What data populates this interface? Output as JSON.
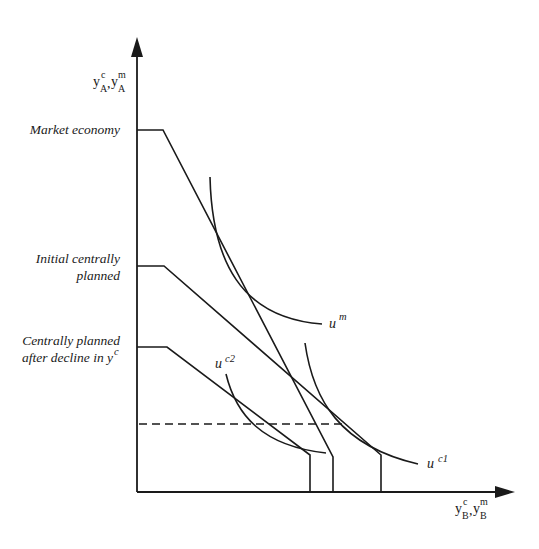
{
  "diagram": {
    "type": "economics-budget-constraint-indifference",
    "y_axis": {
      "base": "y",
      "sup1": "c",
      "sub1": "A",
      "sep": ",",
      "sup2": "m",
      "sub2": "A"
    },
    "x_axis": {
      "base": "y",
      "sup1": "c",
      "sub1": "B",
      "sep": ",",
      "sup2": "m",
      "sub2": "B"
    },
    "levels": [
      {
        "id": "market",
        "label_lines": [
          "Market economy"
        ]
      },
      {
        "id": "initial",
        "label_lines": [
          "Initial centrally",
          "planned"
        ]
      },
      {
        "id": "decline",
        "label_lines": [
          "Centrally planned",
          "after decline in y"
        ],
        "label_sup": "c"
      }
    ],
    "curves": [
      {
        "id": "um",
        "base": "u",
        "sup": "m"
      },
      {
        "id": "uc1",
        "base": "u",
        "sup": "c1"
      },
      {
        "id": "uc2",
        "base": "u",
        "sup": "c2"
      }
    ],
    "colors": {
      "ink": "#1a1a1a",
      "background": "#ffffff"
    }
  }
}
